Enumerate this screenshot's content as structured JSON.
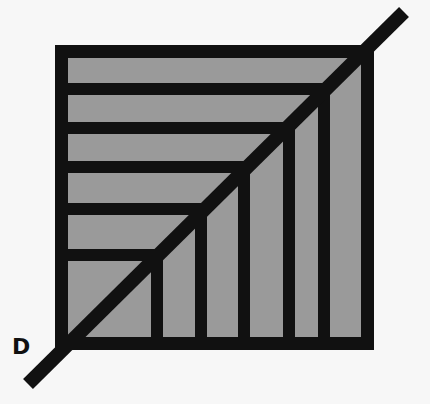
{
  "diagram": {
    "label_d": "D",
    "colors": {
      "background": "#f7f7f7",
      "stroke": "#111111",
      "fill": "#9a9a9a"
    },
    "square": {
      "x": 55,
      "y": 45,
      "w": 319,
      "h": 305,
      "border": 13
    },
    "horizontal_bars_y": [
      89,
      128,
      167,
      209,
      255
    ],
    "vertical_bars_x": [
      157,
      201,
      244,
      289,
      324
    ],
    "bar_thickness": 12,
    "diagonal": {
      "x1": 28,
      "y1": 384,
      "x2": 404,
      "y2": 12,
      "width": 14
    }
  }
}
